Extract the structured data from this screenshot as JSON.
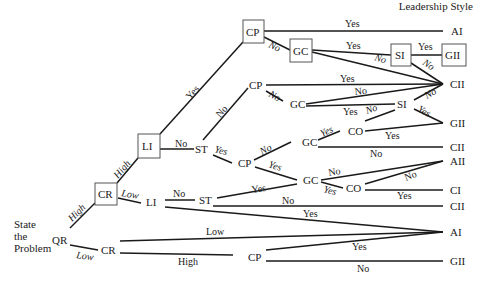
{
  "header": {
    "title": "Leadership Style"
  },
  "root": {
    "label": "State\nthe\nProblem",
    "lines": [
      "State",
      "the",
      "Problem"
    ]
  },
  "nodes": {
    "qr": "QR",
    "cr_high": "CR",
    "cr_low": "CR",
    "li_high": "LI",
    "li_low": "LI",
    "cp_top": "CP",
    "gc_top": "GC",
    "si_top": "SI",
    "st_mid": "ST",
    "cp_mid": "CP",
    "gc_mid": "GC",
    "si_mid": "SI",
    "cp_lower": "CP",
    "gc_lower_a": "GC",
    "co_lower_a": "CO",
    "gc_lower_b": "GC",
    "co_lower_b": "CO",
    "st_low": "ST",
    "cp_bottom": "CP"
  },
  "outcomes": {
    "ai_top": "AI",
    "gii_top": "GII",
    "cii_top": "CII",
    "gii_mid": "GII",
    "cii_mid": "CII",
    "aii": "AII",
    "ci": "CI",
    "cii_low": "CII",
    "ai_bottom": "AI",
    "gii_bottom": "GII"
  },
  "edges": {
    "qr_high": "High",
    "qr_low": "Low",
    "cr_high": "High",
    "cr_low": "Low",
    "li_yes": "Yes",
    "li_no": "No",
    "cp_top_yes": "Yes",
    "cp_top_no": "No",
    "gc_top_yes": "Yes",
    "gc_top_no": "No",
    "si_top_yes": "Yes",
    "si_top_no": "No",
    "st_no": "No",
    "st_yes": "Yes",
    "cp_mid_yes": "Yes",
    "cp_mid_no": "No",
    "gc_mid_yes": "Yes",
    "gc_mid_no": "No",
    "si_mid_no": "No",
    "si_mid_yes": "Yes",
    "si_mid_no2": "No",
    "cp_lower_no": "No",
    "cp_lower_yes": "Yes",
    "gc_a_yes": "Yes",
    "gc_a_no": "No",
    "co_a_yes": "Yes",
    "gc_b_no": "No",
    "gc_b_yes": "Yes",
    "co_b_no": "No",
    "co_b_yes": "Yes",
    "li_low_no": "No",
    "li_low_yes": "Yes",
    "st_low_yes": "Yes",
    "st_low_no": "No",
    "cr_low_low": "Low",
    "cr_low_high": "High",
    "cp_bottom_yes": "Yes",
    "cp_bottom_no": "No"
  }
}
